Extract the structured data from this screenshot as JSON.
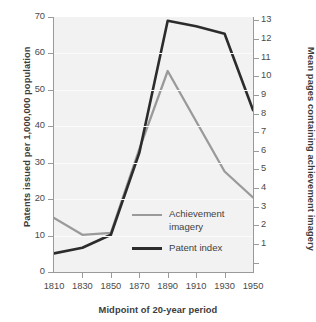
{
  "chart_data": {
    "type": "line",
    "title": "",
    "xlabel": "Midpoint of 20-year period",
    "ylabel_left": "Patents issued per 1,000,000 population",
    "ylabel_right": "Mean pages containing achievement imagery",
    "x": [
      1810,
      1830,
      1850,
      1870,
      1890,
      1910,
      1930,
      1950
    ],
    "xlim": [
      1800,
      1960
    ],
    "xticks": [
      1810,
      1830,
      1850,
      1870,
      1890,
      1910,
      1930,
      1950
    ],
    "xticklabels": [
      "1810",
      "1830",
      "1850",
      "1870",
      "1890",
      "1910",
      "1930",
      "1950"
    ],
    "ylim_left": [
      0,
      70
    ],
    "yticks_left": [
      0,
      10,
      20,
      30,
      40,
      50,
      60,
      70
    ],
    "yticklabels_left": [
      "0",
      "10",
      "20",
      "30",
      "40",
      "50",
      "60",
      "70"
    ],
    "ylim_right": [
      0,
      13.7
    ],
    "yticks_right": [
      1,
      2,
      3,
      4,
      5,
      6,
      7,
      8,
      9,
      10,
      11,
      12,
      13
    ],
    "yticklabels_right": [
      "1",
      "2",
      "3",
      "4",
      "5",
      "6",
      "7",
      "8",
      "9",
      "10",
      "11",
      "12",
      "13"
    ],
    "grid": true,
    "legend_position": "center-right-inside",
    "series": [
      {
        "name": "Achievement imagery",
        "axis": "right",
        "color": "#9a9a9a",
        "values_right_axis": [
          2.9,
          2.0,
          2.1,
          6.6,
          10.8,
          8.1,
          5.4,
          4.0
        ],
        "values_left_axis": [
          15.0,
          10.2,
          10.6,
          34.0,
          54.7,
          41.0,
          27.5,
          20.2
        ]
      },
      {
        "name": "Patent index",
        "axis": "right",
        "color": "#2c2c2c",
        "values_right_axis": [
          1.0,
          1.3,
          2.0,
          6.4,
          13.5,
          13.2,
          12.8,
          8.7
        ],
        "values_left_axis": [
          5.0,
          6.5,
          10.0,
          32.5,
          68.6,
          67.0,
          65.0,
          44.5
        ]
      }
    ]
  },
  "legend": {
    "items": [
      {
        "label": "Achievement imagery",
        "color": "#9a9a9a"
      },
      {
        "label": "Patent index",
        "color": "#2c2c2c"
      }
    ]
  }
}
